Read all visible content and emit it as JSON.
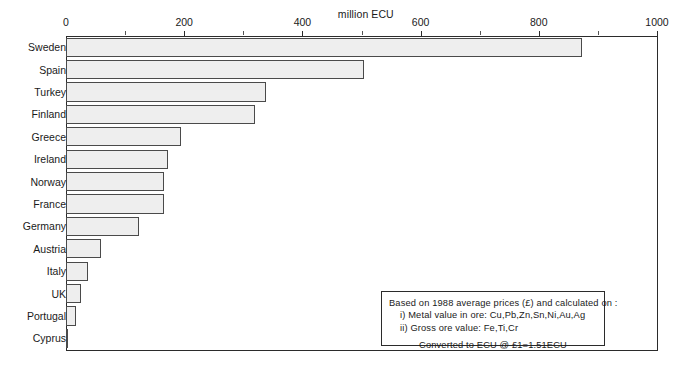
{
  "chart_data": {
    "type": "bar",
    "orientation": "horizontal",
    "title": "",
    "xlabel": "million ECU",
    "ylabel": "",
    "xlim": [
      0,
      1000
    ],
    "xticks": [
      0,
      200,
      400,
      600,
      800,
      1000
    ],
    "xtick_labels": [
      "0",
      "200",
      "400",
      "600",
      "800",
      "1000"
    ],
    "minor_xticks": [
      100,
      300,
      500,
      700,
      900
    ],
    "grid": false,
    "legend": null,
    "categories": [
      "Sweden",
      "Spain",
      "Turkey",
      "Finland",
      "Greece",
      "Ireland",
      "Norway",
      "France",
      "Germany",
      "Austria",
      "Italy",
      "UK",
      "Portugal",
      "Cyprus"
    ],
    "values": [
      873,
      505,
      338,
      320,
      195,
      172,
      165,
      165,
      124,
      60,
      38,
      25,
      17,
      4
    ],
    "annotations": [
      "Based on 1988 average prices (£) and calculated on :",
      "i) Metal value in ore: Cu,Pb,Zn,Sn,Ni,Au,Ag",
      "ii) Gross ore value: Fe,Ti,Cr",
      "Converted to ECU @ £1=1.51ECU"
    ]
  },
  "axis": {
    "unit_label": "million ECU"
  },
  "note": {
    "line1": "Based on 1988 average prices (£) and calculated on :",
    "line2": "i) Metal value in ore: Cu,Pb,Zn,Sn,Ni,Au,Ag",
    "line3": "ii) Gross ore value: Fe,Ti,Cr",
    "line4": "Converted to ECU @ £1=1.51ECU"
  },
  "colors": {
    "bar_fill": "#eeeeee",
    "bar_stroke": "#4a4a4a",
    "axis": "#2b2b2b",
    "text": "#1a1a1a",
    "background": "#ffffff"
  }
}
